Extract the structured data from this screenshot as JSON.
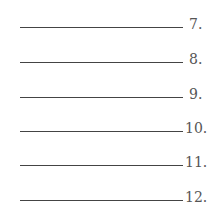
{
  "blanks": [
    {
      "number": "7."
    },
    {
      "number": "8."
    },
    {
      "number": "9."
    },
    {
      "number": "10."
    },
    {
      "number": "11."
    },
    {
      "number": "12."
    }
  ]
}
